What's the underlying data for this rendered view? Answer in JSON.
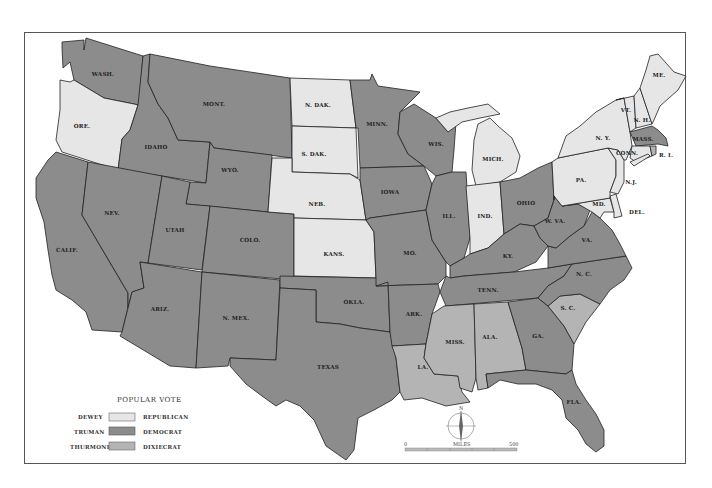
{
  "colors": {
    "republican": "#e6e6e6",
    "democrat": "#8c8c8c",
    "dixiecrat": "#b4b4b4",
    "water": "#ffffff",
    "border": "#222222"
  },
  "legend": {
    "title": "POPULAR VOTE",
    "items": [
      {
        "candidate": "DEWEY",
        "party": "REPUBLICAN",
        "color": "#e6e6e6"
      },
      {
        "candidate": "TRUMAN",
        "party": "DEMOCRAT",
        "color": "#8c8c8c"
      },
      {
        "candidate": "THURMOND",
        "party": "DIXIECRAT",
        "color": "#b4b4b4"
      }
    ]
  },
  "compass": {
    "north_label": "N"
  },
  "scale": {
    "start": "0",
    "unit": "MILES",
    "end": "500"
  },
  "states": {
    "wash": "WASH.",
    "ore": "ORE.",
    "calif": "CALIF.",
    "idaho": "IDAHO",
    "nev": "NEV.",
    "mont": "MONT.",
    "wyo": "WYO.",
    "utah": "UTAH",
    "ariz": "ARIZ.",
    "colo": "COLO.",
    "nmex": "N. MEX.",
    "ndak": "N. DAK.",
    "sdak": "S. DAK.",
    "neb": "NEB.",
    "kans": "KANS.",
    "okla": "OKLA.",
    "texas": "TEXAS",
    "minn": "MINN.",
    "iowa": "IOWA",
    "mo": "MO.",
    "ark": "ARK.",
    "la": "LA.",
    "wis": "WIS.",
    "ill": "ILL.",
    "mich": "MICH.",
    "ind": "IND.",
    "ohio": "OHIO",
    "ky": "KY.",
    "tenn": "TENN.",
    "miss": "MISS.",
    "ala": "ALA.",
    "ga": "GA.",
    "fla": "FLA.",
    "sc": "S. C.",
    "nc": "N. C.",
    "va": "VA.",
    "wva": "W. VA.",
    "md": "MD.",
    "del": "DEL.",
    "pa": "PA.",
    "nj": "N.J.",
    "ny": "N. Y.",
    "conn": "CONN.",
    "ri": "R. I.",
    "mass": "MASS.",
    "vt": "VT.",
    "nh": "N. H.",
    "me": "ME."
  },
  "results": {
    "republican": [
      "ORE.",
      "N. DAK.",
      "S. DAK.",
      "NEB.",
      "KANS.",
      "MICH.",
      "IND.",
      "N. Y.",
      "PA.",
      "N.J.",
      "MD.",
      "DEL.",
      "CONN.",
      "VT.",
      "N. H.",
      "ME."
    ],
    "democrat": [
      "WASH.",
      "CALIF.",
      "IDAHO",
      "NEV.",
      "MONT.",
      "WYO.",
      "UTAH",
      "ARIZ.",
      "COLO.",
      "N. MEX.",
      "OKLA.",
      "TEXAS",
      "MINN.",
      "IOWA",
      "MO.",
      "ARK.",
      "WIS.",
      "ILL.",
      "OHIO",
      "KY.",
      "TENN.",
      "GA.",
      "FLA.",
      "N. C.",
      "VA.",
      "W. VA.",
      "R. I.",
      "MASS."
    ],
    "dixiecrat": [
      "LA.",
      "MISS.",
      "ALA.",
      "S. C."
    ]
  }
}
